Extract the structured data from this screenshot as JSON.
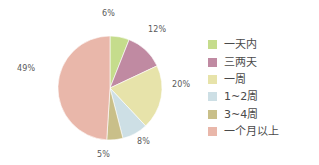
{
  "chart_data": {
    "type": "pie",
    "title": "",
    "categories": [
      "一天内",
      "三两天",
      "一周",
      "1~2周",
      "3~4周",
      "一个月以上"
    ],
    "values": [
      6,
      12,
      20,
      8,
      5,
      49
    ],
    "value_labels": [
      "6%",
      "12%",
      "20%",
      "8%",
      "5%",
      "49%"
    ],
    "colors": [
      "#c5dc8c",
      "#c08aa2",
      "#e7e3aa",
      "#cddfe5",
      "#c9bf89",
      "#e9b7aa"
    ],
    "legend_position": "right",
    "start_angle": 0,
    "direction": "clockwise",
    "grid": false,
    "xlabel": "",
    "ylabel": ""
  },
  "labels": {
    "slice_0": "6%",
    "slice_1": "12%",
    "slice_2": "20%",
    "slice_3": "8%",
    "slice_4": "5%",
    "slice_5": "49%"
  },
  "legend": {
    "items": [
      {
        "label": "一天内",
        "color": "#c5dc8c"
      },
      {
        "label": "三两天",
        "color": "#c08aa2"
      },
      {
        "label": "一周",
        "color": "#e7e3aa"
      },
      {
        "label": "1~2周",
        "color": "#cddfe5"
      },
      {
        "label": "3~4周",
        "color": "#c9bf89"
      },
      {
        "label": "一个月以上",
        "color": "#e9b7aa"
      }
    ]
  }
}
